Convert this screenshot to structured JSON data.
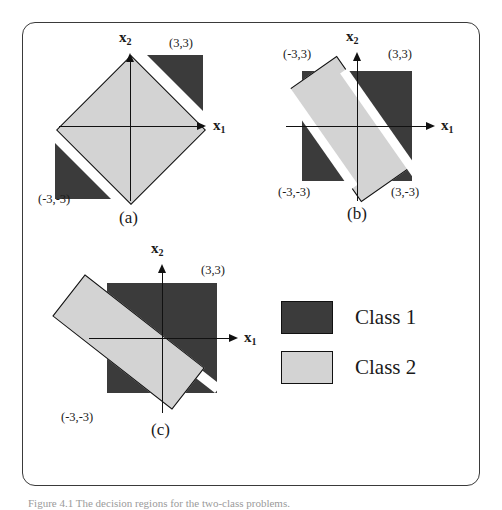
{
  "figure": {
    "caption": "Figure 4.1  The decision regions for the two-class problems.",
    "border_color": "#3a3a3a",
    "class1_color": "#3b3b3b",
    "class2_color": "#d3d3d3"
  },
  "panels": [
    {
      "tag": "(a)",
      "x_axis_label": "x",
      "x_axis_sub": "1",
      "y_axis_label": "x",
      "y_axis_sub": "2",
      "coords": [
        {
          "text": "(3,3)",
          "corner": "upper-right"
        },
        {
          "text": "(-3,-3)",
          "corner": "lower-left"
        }
      ]
    },
    {
      "tag": "(b)",
      "x_axis_label": "x",
      "x_axis_sub": "1",
      "y_axis_label": "x",
      "y_axis_sub": "2",
      "coords": [
        {
          "text": "(-3,3)",
          "corner": "upper-left"
        },
        {
          "text": "(3,3)",
          "corner": "upper-right"
        },
        {
          "text": "(-3,-3)",
          "corner": "lower-left"
        },
        {
          "text": "(3,-3)",
          "corner": "lower-right"
        }
      ]
    },
    {
      "tag": "(c)",
      "x_axis_label": "x",
      "x_axis_sub": "1",
      "y_axis_label": "x",
      "y_axis_sub": "2",
      "coords": [
        {
          "text": "(3,3)",
          "corner": "upper-right"
        },
        {
          "text": "(-3,-3)",
          "corner": "lower-left"
        }
      ]
    }
  ],
  "legend": {
    "items": [
      {
        "label": "Class 1",
        "swatch": "dark"
      },
      {
        "label": "Class 2",
        "swatch": "light"
      }
    ]
  }
}
